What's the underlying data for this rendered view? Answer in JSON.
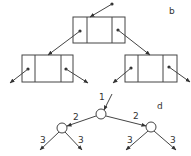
{
  "panels": {
    "b": {
      "label": "b",
      "description": "Linked binary tree nodes: each node has left pointer, data, right pointer fields"
    },
    "d": {
      "label": "d",
      "root_edge_label": "1",
      "child_edge_labels": [
        "2",
        "2"
      ],
      "leaf_edge_labels": [
        "3",
        "3",
        "3",
        "3"
      ]
    }
  },
  "colors": {
    "stroke": "#333333",
    "background": "#ffffff"
  }
}
